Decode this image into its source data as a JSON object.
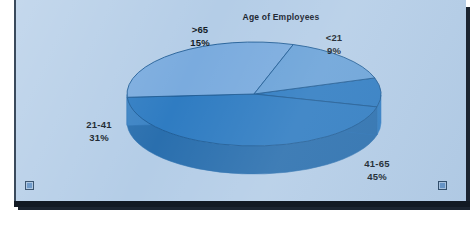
{
  "slide": {
    "name": "pie-chart-slide",
    "background_color": "#b4cde7",
    "frame_border_color": "#3a4a5c"
  },
  "chart_data": {
    "type": "pie",
    "title": "Age of Employees",
    "xlabel": "",
    "ylabel": "",
    "three_d": true,
    "legend_position": "none",
    "labels_outside": true,
    "categories": [
      "<21",
      "41-65",
      "21-41",
      ">65"
    ],
    "values": [
      9,
      45,
      31,
      15
    ],
    "value_suffix": "%",
    "slices": [
      {
        "label": "<21",
        "percent_text": "9%",
        "value": 9,
        "color": "#2f7cc2",
        "side_color": "#2f7cc2",
        "start_angle": -18,
        "sweep_angle": 32.4
      },
      {
        "label": "41-65",
        "percent_text": "45%",
        "value": 45,
        "color": "#2f7cc2",
        "side_color": "#2a6fae",
        "start_angle": 14.4,
        "sweep_angle": 162.0
      },
      {
        "label": "21-41",
        "percent_text": "31%",
        "value": 31,
        "color": "#7aabde",
        "side_color": "#3c83c4",
        "start_angle": 176.4,
        "sweep_angle": 111.6
      },
      {
        "label": ">65",
        "percent_text": "15%",
        "value": 15,
        "color": "#6aa2d8",
        "side_color": "#3c83c4",
        "start_angle": 288.0,
        "sweep_angle": 54.0
      }
    ],
    "colors": {
      "dark_blue": "#2f7cc2",
      "mid_blue": "#6aa2d8",
      "light_blue": "#7aabde",
      "outline": "#1d5a93",
      "background": "#b4cde7"
    }
  },
  "labels": {
    "gt65": {
      "name": ">65",
      "percent": "15%"
    },
    "lt21": {
      "name": "<21",
      "percent": "9%"
    },
    "r21_41": {
      "name": "21-41",
      "percent": "31%"
    },
    "r41_65": {
      "name": "41-65",
      "percent": "45%"
    }
  },
  "handles": {
    "bottom_left": "selection-handle",
    "bottom_right": "selection-handle"
  }
}
